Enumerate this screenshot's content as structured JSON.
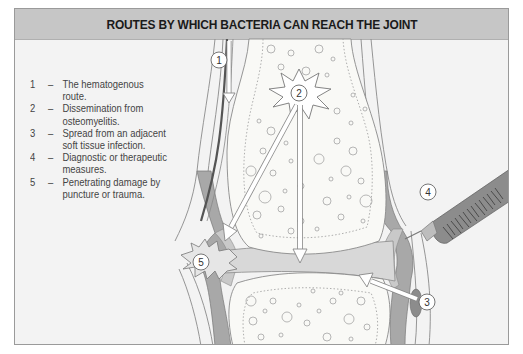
{
  "header": {
    "title": "ROUTES BY WHICH BACTERIA CAN REACH THE JOINT"
  },
  "legend": {
    "items": [
      {
        "num": "1",
        "dash": "–",
        "text": "The hematogenous route."
      },
      {
        "num": "2",
        "dash": "–",
        "text": "Dissemination from osteomyelitis."
      },
      {
        "num": "3",
        "dash": "–",
        "text": "Spread from an adjacent soft tissue infection."
      },
      {
        "num": "4",
        "dash": "–",
        "text": "Diagnostic or therapeutic measures."
      },
      {
        "num": "5",
        "dash": "–",
        "text": "Penetrating damage by puncture or trauma."
      }
    ]
  },
  "labels": {
    "l1": "1",
    "l2": "2",
    "l3": "3",
    "l4": "4",
    "l5": "5"
  },
  "colors": {
    "header_bg": "#c6c6c6",
    "panel_bg": "#f3f3f3",
    "bone": "#f9f9f6",
    "capsule": "#a9a9a9",
    "synovium": "#c8c8c8",
    "joint_space": "#d9d9d9",
    "syringe": "#8c8c8c"
  }
}
